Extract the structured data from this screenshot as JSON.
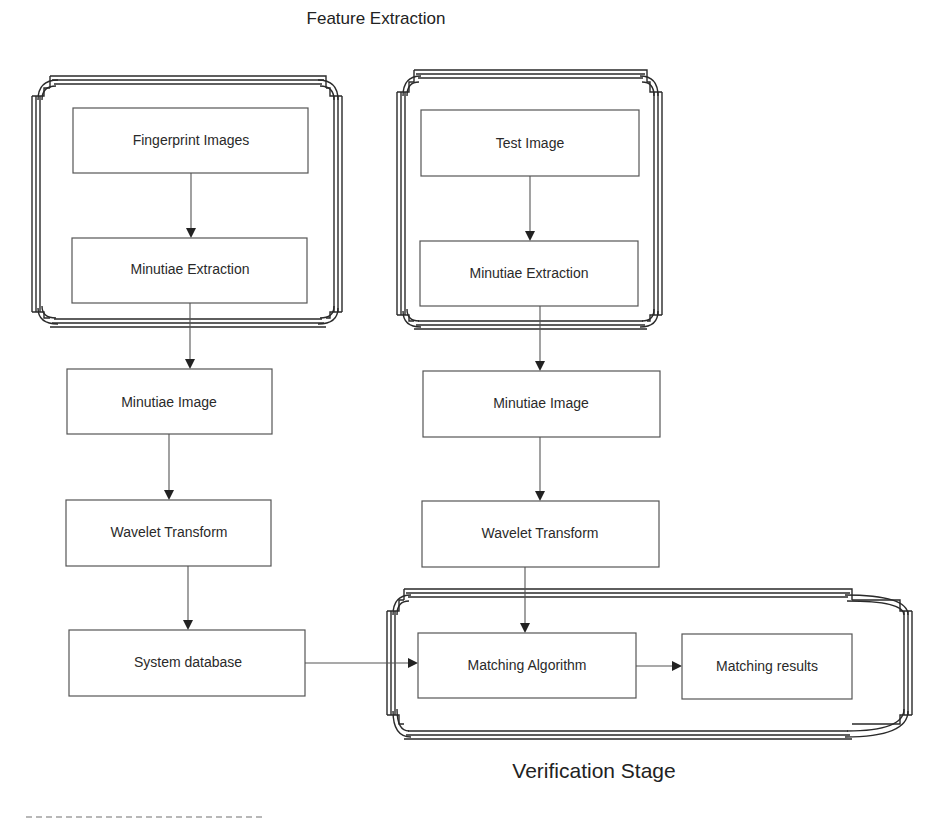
{
  "diagram": {
    "title_top": "Feature Extraction",
    "title_bottom": "Verification Stage",
    "groups": [
      {
        "id": "enrollment-feature-extraction",
        "contains": [
          "fingerprint-images",
          "minutiae-extraction-left"
        ]
      },
      {
        "id": "test-feature-extraction",
        "contains": [
          "test-image",
          "minutiae-extraction-right"
        ]
      },
      {
        "id": "verification-stage",
        "label": "Verification Stage",
        "contains": [
          "matching-algorithm",
          "matching-results"
        ]
      }
    ],
    "nodes": {
      "fingerprint_images": "Fingerprint Images",
      "minutiae_extraction_left": "Minutiae Extraction",
      "minutiae_image_left": "Minutiae Image",
      "wavelet_transform_left": "Wavelet Transform",
      "system_database": "System database",
      "test_image": "Test Image",
      "minutiae_extraction_right": "Minutiae Extraction",
      "minutiae_image_right": "Minutiae Image",
      "wavelet_transform_right": "Wavelet Transform",
      "matching_algorithm": "Matching Algorithm",
      "matching_results": "Matching results"
    },
    "edges": [
      {
        "from": "Fingerprint Images",
        "to": "Minutiae Extraction (left)"
      },
      {
        "from": "Minutiae Extraction (left)",
        "to": "Minutiae Image (left)"
      },
      {
        "from": "Minutiae Image (left)",
        "to": "Wavelet Transform (left)"
      },
      {
        "from": "Wavelet Transform (left)",
        "to": "System database"
      },
      {
        "from": "System database",
        "to": "Matching Algorithm"
      },
      {
        "from": "Test Image",
        "to": "Minutiae Extraction (right)"
      },
      {
        "from": "Minutiae Extraction (right)",
        "to": "Minutiae Image (right)"
      },
      {
        "from": "Minutiae Image (right)",
        "to": "Wavelet Transform (right)"
      },
      {
        "from": "Wavelet Transform (right)",
        "to": "Matching Algorithm"
      },
      {
        "from": "Matching Algorithm",
        "to": "Matching results"
      }
    ],
    "colors": {
      "background": "#ffffff",
      "stroke": "#2a2a2a",
      "text": "#2a2a2a"
    }
  }
}
